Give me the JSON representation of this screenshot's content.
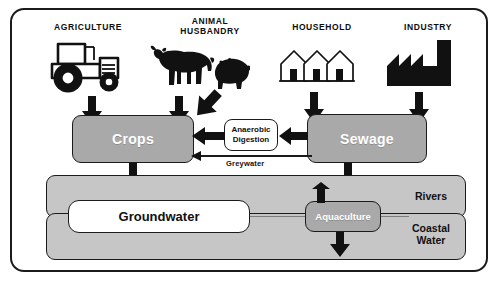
{
  "diagram": {
    "colors": {
      "box_gray": "#a9a9a9",
      "band_gray": "#c6c6c6",
      "outline": "#1b1b1b",
      "white": "#ffffff",
      "arrow": "#1b1b1b"
    },
    "sources": [
      {
        "id": "agriculture",
        "label": "AGRICULTURE",
        "icon": "tractor-icon"
      },
      {
        "id": "animal-husbandry",
        "label": "ANIMAL\nHUSBANDRY",
        "icon": "cow-and-pig-icon"
      },
      {
        "id": "household",
        "label": "HOUSEHOLD",
        "icon": "three-houses-icon"
      },
      {
        "id": "industry",
        "label": "INDUSTRY",
        "icon": "factory-icon"
      }
    ],
    "nodes": [
      {
        "id": "crops",
        "label": "Crops",
        "style": "gray"
      },
      {
        "id": "anaerobic-digestion",
        "label": "Anaerobic\nDigestion",
        "style": "white"
      },
      {
        "id": "sewage",
        "label": "Sewage",
        "style": "gray"
      },
      {
        "id": "groundwater",
        "label": "Groundwater",
        "style": "white"
      },
      {
        "id": "aquaculture",
        "label": "Aquaculture",
        "style": "gray"
      }
    ],
    "bands": [
      {
        "id": "rivers",
        "label": "Rivers"
      },
      {
        "id": "coastal-water",
        "label": "Coastal\nWater"
      }
    ],
    "edge_labels": [
      {
        "id": "greywater",
        "label": "Greywater"
      }
    ],
    "flows": [
      {
        "from": "agriculture",
        "to": "crops",
        "kind": "thick-down"
      },
      {
        "from": "animal-husbandry",
        "to": "crops",
        "kind": "thick-down"
      },
      {
        "from": "animal-husbandry",
        "to": "sewage-side",
        "kind": "thick-diagonal"
      },
      {
        "from": "household",
        "to": "sewage",
        "kind": "thick-down"
      },
      {
        "from": "industry",
        "to": "sewage",
        "kind": "thick-down"
      },
      {
        "from": "sewage",
        "to": "anaerobic-digestion",
        "kind": "thick-left"
      },
      {
        "from": "anaerobic-digestion",
        "to": "crops",
        "kind": "thick-left"
      },
      {
        "from": "sewage",
        "to": "crops",
        "kind": "thin-left",
        "label": "Greywater"
      },
      {
        "from": "crops",
        "to": "groundwater",
        "kind": "thick-down"
      },
      {
        "from": "sewage",
        "to": "rivers",
        "kind": "thick-down"
      },
      {
        "from": "aquaculture",
        "to": "rivers",
        "kind": "thick-up"
      },
      {
        "from": "aquaculture",
        "to": "coastal-water",
        "kind": "thick-down"
      }
    ]
  }
}
